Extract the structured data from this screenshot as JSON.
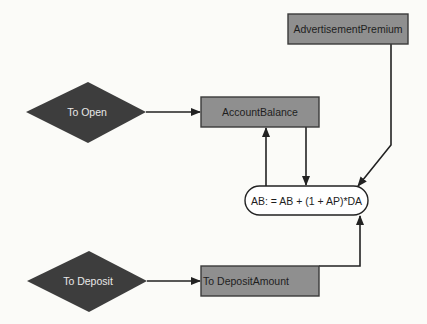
{
  "diagram": {
    "type": "flowchart",
    "colors": {
      "background": "#fbfbf8",
      "diamond_fill": "#3d3d3d",
      "diamond_text": "#e8e8e8",
      "box_fill": "#8f8f8f",
      "box_stroke": "#3a3a3a",
      "box_text": "#1e1e1e",
      "edge": "#222222",
      "formula_fill": "#ffffff"
    },
    "nodes": {
      "to_open": {
        "label": "To Open",
        "shape": "diamond"
      },
      "to_deposit": {
        "label": "To Deposit",
        "shape": "diamond"
      },
      "account_balance": {
        "label": "AccountBalance",
        "shape": "rectangle"
      },
      "advertisement_premium": {
        "label": "AdvertisementPremium",
        "shape": "rectangle"
      },
      "deposit_amount": {
        "label": "To DepositAmount",
        "shape": "rectangle"
      },
      "formula": {
        "label": "AB: = AB + (1 + AP)*DA",
        "shape": "rounded"
      }
    },
    "edges": [
      {
        "from": "to_open",
        "to": "account_balance"
      },
      {
        "from": "account_balance",
        "to": "formula"
      },
      {
        "from": "formula",
        "to": "account_balance"
      },
      {
        "from": "advertisement_premium",
        "to": "formula"
      },
      {
        "from": "to_deposit",
        "to": "deposit_amount"
      },
      {
        "from": "deposit_amount",
        "to": "formula"
      }
    ]
  }
}
